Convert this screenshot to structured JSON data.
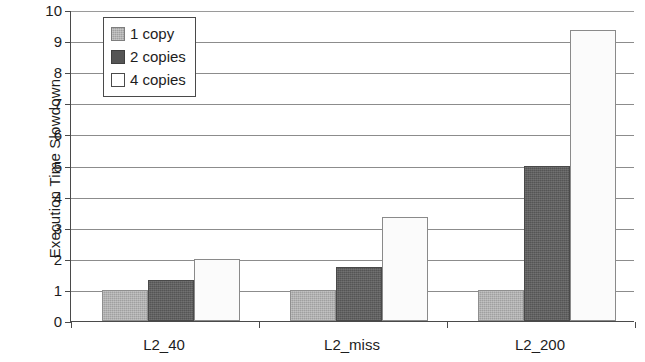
{
  "chart_data": {
    "type": "bar",
    "title": "",
    "xlabel": "",
    "ylabel": "Execution Time Slowdown",
    "categories": [
      "L2_40",
      "L2_miss",
      "L2_200"
    ],
    "series": [
      {
        "name": "1 copy",
        "values": [
          1.0,
          1.0,
          1.0
        ],
        "color": "#a0a0a0"
      },
      {
        "name": "2 copies",
        "values": [
          1.33,
          1.75,
          5.0
        ],
        "color": "#555555"
      },
      {
        "name": "4 copies",
        "values": [
          1.98,
          3.35,
          9.35
        ],
        "color": "#ffffff"
      }
    ],
    "ylim": [
      0,
      10
    ],
    "y_ticks": [
      0,
      1,
      2,
      3,
      4,
      5,
      6,
      7,
      8,
      9,
      10
    ],
    "y_tick_labels": [
      "0",
      "1",
      "2",
      "3",
      "4",
      "5",
      "6",
      "7",
      "8",
      "9",
      "10"
    ],
    "grid": true,
    "grid_axis": "y",
    "legend_position": "upper-left",
    "legend_entries": [
      "1 copy",
      "2 copies",
      "4 copies"
    ]
  }
}
